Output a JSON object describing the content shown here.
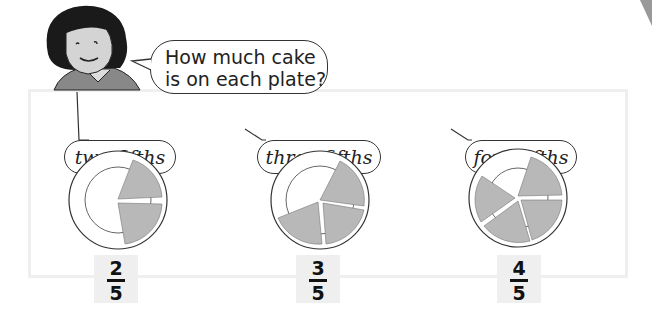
{
  "question": {
    "text_line1": "How much cake",
    "text_line2": "is on each plate?"
  },
  "plates": [
    {
      "label": "two fifths",
      "numerator": "2",
      "denominator": "5",
      "filled_slices": 2,
      "total_slices": 5
    },
    {
      "label": "three fifths",
      "numerator": "3",
      "denominator": "5",
      "filled_slices": 3,
      "total_slices": 5
    },
    {
      "label": "four fifths",
      "numerator": "4",
      "denominator": "5",
      "filled_slices": 4,
      "total_slices": 5
    }
  ],
  "colors": {
    "cake_fill": "#b8b8b8",
    "frame": "#efefef",
    "fraction_box": "#efefef",
    "outline": "#333333"
  }
}
